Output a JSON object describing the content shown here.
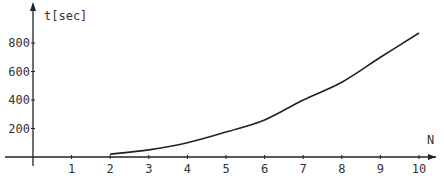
{
  "chart_data": {
    "type": "line",
    "title": "",
    "xlabel": "N",
    "ylabel": "t[sec]",
    "x_ticks": [
      "1",
      "2",
      "3",
      "4",
      "5",
      "6",
      "7",
      "8",
      "9",
      "10"
    ],
    "y_ticks": [
      "200",
      "400",
      "600",
      "800"
    ],
    "xlim": [
      0,
      10.5
    ],
    "ylim": [
      0,
      950
    ],
    "grid": false,
    "legend": null,
    "series": [
      {
        "name": "t",
        "x": [
          2,
          3,
          4,
          5,
          6,
          7,
          8,
          9,
          10
        ],
        "values": [
          20,
          50,
          100,
          175,
          260,
          400,
          525,
          700,
          870
        ]
      }
    ]
  },
  "colors": {
    "line": "#222222",
    "axis": "#222222",
    "text": "#333333"
  }
}
